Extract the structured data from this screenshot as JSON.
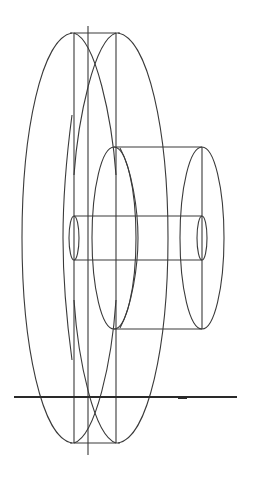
{
  "diagram": {
    "title": "",
    "colors": {
      "background": "#ffffff",
      "stroke": "#3a3a3a"
    },
    "components": [
      {
        "name": "large-disc-front",
        "shape": "ellipse",
        "cx": 74,
        "cy": 238,
        "rx": 52,
        "ry": 205
      },
      {
        "name": "large-disc-back",
        "shape": "ellipse",
        "cx": 116,
        "cy": 238,
        "rx": 52,
        "ry": 205
      },
      {
        "name": "disc-rim-lines",
        "shape": "lines",
        "x": [
          74,
          116
        ],
        "y1": 33,
        "y2": 443
      },
      {
        "name": "center-axis",
        "shape": "line",
        "x": 88,
        "y1": 26,
        "y2": 455
      },
      {
        "name": "hub-cylinder",
        "shape": "cylinder",
        "x1": 116,
        "x2": 202,
        "top": 147,
        "bottom": 329,
        "end_rx": 22
      },
      {
        "name": "shaft-cylinder",
        "shape": "cylinder",
        "x1": 74,
        "x2": 202,
        "top": 216,
        "bottom": 260,
        "end_rx": 5
      },
      {
        "name": "ground-line",
        "shape": "line",
        "y": 397,
        "x1": 14,
        "x2": 237
      }
    ]
  }
}
